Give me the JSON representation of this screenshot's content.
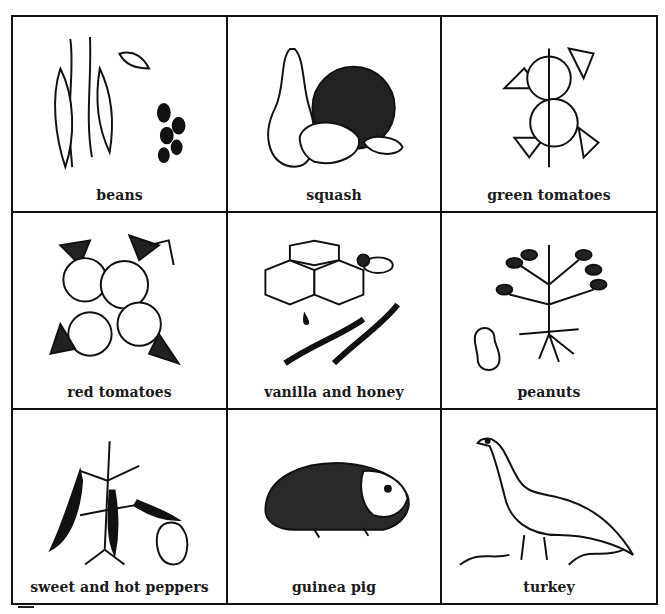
{
  "grid": {
    "rows": 3,
    "columns": 3,
    "cells": [
      {
        "label": "beans",
        "icon": "beans-icon"
      },
      {
        "label": "squash",
        "icon": "squash-icon"
      },
      {
        "label": "green tomatoes",
        "icon": "green-tomatoes-icon"
      },
      {
        "label": "red tomatoes",
        "icon": "red-tomatoes-icon"
      },
      {
        "label": "vanilla and honey",
        "icon": "vanilla-honey-icon"
      },
      {
        "label": "peanuts",
        "icon": "peanuts-icon"
      },
      {
        "label": "sweet and hot peppers",
        "icon": "peppers-icon"
      },
      {
        "label": "guinea pig",
        "icon": "guinea-pig-icon"
      },
      {
        "label": "turkey",
        "icon": "turkey-icon"
      }
    ]
  },
  "colors": {
    "ink": "#111111",
    "paper": "#ffffff"
  }
}
